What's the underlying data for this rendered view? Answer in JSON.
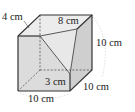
{
  "diagram": {
    "type": "cube-with-cut-corner",
    "labels": {
      "top_left_edge": "4 cm",
      "top_back_edge": "8 cm",
      "right_height": "10 cm",
      "front_right_lower": "3 cm",
      "bottom_right_depth": "10 cm",
      "bottom_front_width": "10 cm"
    },
    "colors": {
      "edge": "#333333",
      "face_front": "#dcdcdc",
      "face_top": "#ececec",
      "face_side": "#cfcfcf",
      "cut_face": "#e6e6e6",
      "guide_arc": "#c8c8c8"
    }
  }
}
